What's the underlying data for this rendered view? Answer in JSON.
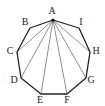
{
  "figure": {
    "shape": "nonagon",
    "apex_vertex": "A",
    "stroke_color": "#222222",
    "vertices": [
      {
        "name": "A",
        "x": 53,
        "y": 20,
        "label_x": 52,
        "label_y": 12
      },
      {
        "name": "B",
        "x": 30,
        "y": 28,
        "label_x": 25,
        "label_y": 23
      },
      {
        "name": "C",
        "x": 17,
        "y": 52,
        "label_x": 10,
        "label_y": 52
      },
      {
        "name": "D",
        "x": 21,
        "y": 78,
        "label_x": 14,
        "label_y": 81
      },
      {
        "name": "E",
        "x": 41,
        "y": 94,
        "label_x": 40,
        "label_y": 101
      },
      {
        "name": "F",
        "x": 67,
        "y": 94,
        "label_x": 67,
        "label_y": 101
      },
      {
        "name": "G",
        "x": 86,
        "y": 78,
        "label_x": 91,
        "label_y": 81
      },
      {
        "name": "H",
        "x": 90,
        "y": 52,
        "label_x": 96,
        "label_y": 52
      },
      {
        "name": "I",
        "x": 79,
        "y": 28,
        "label_x": 81,
        "label_y": 23
      }
    ],
    "diagonals": [
      "AC",
      "AD",
      "AE",
      "AF",
      "AG",
      "AH"
    ],
    "labels": {
      "A": "A",
      "B": "B",
      "C": "C",
      "D": "D",
      "E": "E",
      "F": "F",
      "G": "G",
      "H": "H",
      "I": "I"
    }
  }
}
